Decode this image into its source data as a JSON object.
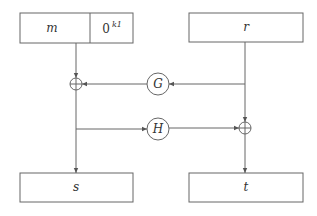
{
  "diagram": {
    "boxes": {
      "m": "m",
      "zero_pad": "0",
      "zero_pad_exp": "k1",
      "r": "r",
      "s": "s",
      "t": "t"
    },
    "functions": {
      "G": "G",
      "H": "H"
    },
    "operators": {
      "xor": "⊕"
    },
    "colors": {
      "stroke": "#555555",
      "text": "#333333"
    }
  }
}
